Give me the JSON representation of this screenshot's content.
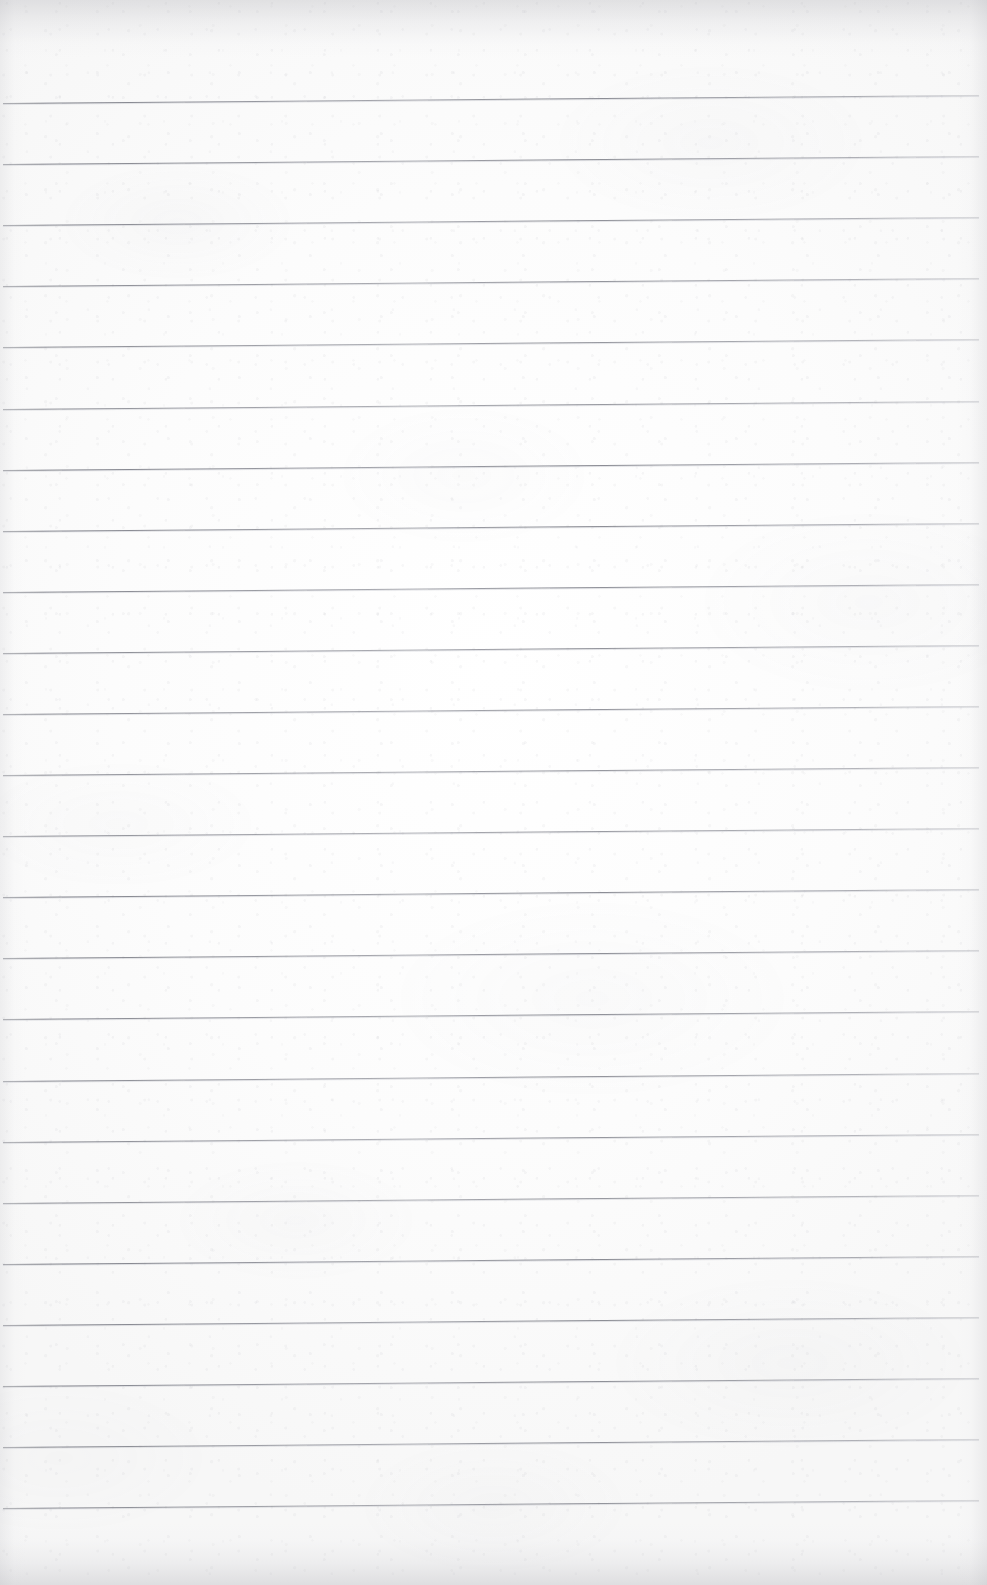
{
  "document": {
    "kind": "scanned-lined-notebook-page",
    "title": "Blank Ruled Notebook Page",
    "written_content": "",
    "text_visible": "none",
    "page_width_px": 987,
    "page_height_px": 1585
  },
  "paper": {
    "background_color": "#fbfbfb",
    "highlight_color": "#ffffff",
    "shade_color": "#f5f5f5",
    "texture": "fibrous scan grain with soft blotches",
    "edge_shadow_color": "#aaaab0"
  },
  "ruling": {
    "line_color": "#6c6e78",
    "line_color_light": "#9a9ca4",
    "line_thickness_px": 1,
    "line_count": 24,
    "first_line_y_px": 103,
    "line_spacing_px": 61.1,
    "left_inset_px": 3,
    "right_inset_px": 8,
    "skew_drop_px": 8,
    "skew_degrees": -0.47,
    "lines": [
      {
        "index": 1,
        "y_px": 103,
        "left_x_px": 3,
        "width_px": 976
      },
      {
        "index": 2,
        "y_px": 164,
        "left_x_px": 3,
        "width_px": 976
      },
      {
        "index": 3,
        "y_px": 225,
        "left_x_px": 3,
        "width_px": 976
      },
      {
        "index": 4,
        "y_px": 286,
        "left_x_px": 3,
        "width_px": 976
      },
      {
        "index": 5,
        "y_px": 347,
        "left_x_px": 3,
        "width_px": 976
      },
      {
        "index": 6,
        "y_px": 409,
        "left_x_px": 3,
        "width_px": 976
      },
      {
        "index": 7,
        "y_px": 470,
        "left_x_px": 3,
        "width_px": 976
      },
      {
        "index": 8,
        "y_px": 531,
        "left_x_px": 3,
        "width_px": 976
      },
      {
        "index": 9,
        "y_px": 592,
        "left_x_px": 3,
        "width_px": 976
      },
      {
        "index": 10,
        "y_px": 653,
        "left_x_px": 3,
        "width_px": 976
      },
      {
        "index": 11,
        "y_px": 714,
        "left_x_px": 3,
        "width_px": 976
      },
      {
        "index": 12,
        "y_px": 775,
        "left_x_px": 3,
        "width_px": 976
      },
      {
        "index": 13,
        "y_px": 836,
        "left_x_px": 3,
        "width_px": 976
      },
      {
        "index": 14,
        "y_px": 897,
        "left_x_px": 3,
        "width_px": 976
      },
      {
        "index": 15,
        "y_px": 958,
        "left_x_px": 3,
        "width_px": 976
      },
      {
        "index": 16,
        "y_px": 1019,
        "left_x_px": 3,
        "width_px": 976
      },
      {
        "index": 17,
        "y_px": 1081,
        "left_x_px": 3,
        "width_px": 976
      },
      {
        "index": 18,
        "y_px": 1142,
        "left_x_px": 3,
        "width_px": 976
      },
      {
        "index": 19,
        "y_px": 1203,
        "left_x_px": 3,
        "width_px": 976
      },
      {
        "index": 20,
        "y_px": 1264,
        "left_x_px": 3,
        "width_px": 976
      },
      {
        "index": 21,
        "y_px": 1325,
        "left_x_px": 3,
        "width_px": 976
      },
      {
        "index": 22,
        "y_px": 1386,
        "left_x_px": 3,
        "width_px": 976
      },
      {
        "index": 23,
        "y_px": 1447,
        "left_x_px": 3,
        "width_px": 976
      },
      {
        "index": 24,
        "y_px": 1508,
        "left_x_px": 3,
        "width_px": 976
      }
    ]
  },
  "margins": {
    "top_blank_px": 103,
    "bottom_blank_px": 77,
    "has_vertical_margin_rule": false
  }
}
